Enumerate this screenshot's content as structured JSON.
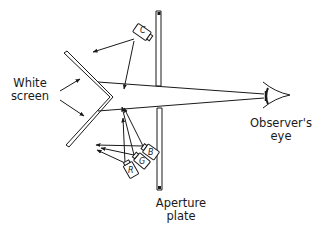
{
  "labels": {
    "screen_line1": "White",
    "screen_line2": "screen",
    "eye_line1": "Observer's",
    "eye_line2": "eye",
    "plate_line1": "Aperture",
    "plate_line2": "plate"
  },
  "projectors": [
    {
      "id": "C",
      "letter": "C"
    },
    {
      "id": "B",
      "letter": "B"
    },
    {
      "id": "G",
      "letter": "G"
    },
    {
      "id": "R",
      "letter": "R"
    }
  ],
  "colors": {
    "ink": "#1a1a1a",
    "background": "#ffffff"
  }
}
